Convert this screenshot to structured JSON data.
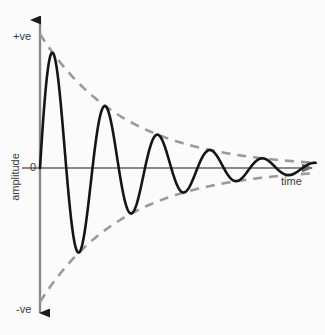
{
  "figure": {
    "background_color": "#fbfbfb",
    "axis_color": "#808080",
    "curve_color": "#151515",
    "envelope_color": "#9a9a9a",
    "text_color": "#3a3a3a"
  },
  "labels": {
    "positive": "+ve",
    "negative": "-ve",
    "zero": "0",
    "y_axis": "amplitude",
    "x_axis": "time"
  },
  "chart_data": {
    "type": "line",
    "title": "",
    "subtitle": "",
    "xlabel": "time",
    "ylabel": "amplitude",
    "grid": false,
    "legend": "none",
    "axis_ticks": {
      "y": [
        "+ve",
        "0",
        "-ve"
      ],
      "x": []
    },
    "xlim": [
      0,
      5.25
    ],
    "ylim": [
      -1.15,
      1.15
    ],
    "series": [
      {
        "name": "damped oscillation",
        "style": "solid",
        "color": "#151515",
        "model": "A*exp(-k*t)*sin(2*pi*t/T)",
        "amplitude": 1.0,
        "decay_constant": 0.62,
        "period": 1.0,
        "phase": 0,
        "x": [
          0,
          0.25,
          0.5,
          0.75,
          1.0,
          1.25,
          1.5,
          1.75,
          2.0,
          2.25,
          2.5,
          2.75,
          3.0,
          3.25,
          3.5,
          3.75,
          4.0,
          4.25,
          4.5,
          4.75,
          5.0,
          5.25
        ],
        "values": [
          0,
          0.857,
          0,
          -0.735,
          0,
          0.458,
          0,
          -0.393,
          0,
          0.245,
          0,
          -0.21,
          0,
          0.131,
          0,
          -0.112,
          0,
          0.07,
          0,
          -0.06,
          0,
          0.037
        ]
      },
      {
        "name": "upper envelope",
        "style": "dashed",
        "color": "#9a9a9a",
        "model": "A*exp(-k*t)",
        "x": [
          0,
          0.5,
          1.0,
          1.5,
          2.0,
          2.5,
          3.0,
          3.5,
          4.0,
          4.5,
          5.0,
          5.25
        ],
        "values": [
          1.0,
          0.733,
          0.538,
          0.394,
          0.289,
          0.212,
          0.155,
          0.114,
          0.083,
          0.061,
          0.045,
          0.038
        ]
      },
      {
        "name": "lower envelope",
        "style": "dashed",
        "color": "#9a9a9a",
        "model": "-A*exp(-k*t)",
        "x": [
          0,
          0.5,
          1.0,
          1.5,
          2.0,
          2.5,
          3.0,
          3.5,
          4.0,
          4.5,
          5.0,
          5.25
        ],
        "values": [
          -1.0,
          -0.733,
          -0.538,
          -0.394,
          -0.289,
          -0.212,
          -0.155,
          -0.114,
          -0.083,
          -0.061,
          -0.045,
          -0.038
        ]
      }
    ],
    "key_points": {
      "peaks": [
        {
          "x": 0.25,
          "y": 0.857
        },
        {
          "x": 1.25,
          "y": 0.458
        },
        {
          "x": 2.25,
          "y": 0.245
        },
        {
          "x": 3.25,
          "y": 0.131
        },
        {
          "x": 4.25,
          "y": 0.07
        }
      ],
      "troughs": [
        {
          "x": 0.75,
          "y": -0.735
        },
        {
          "x": 1.75,
          "y": -0.393
        },
        {
          "x": 2.75,
          "y": -0.21
        },
        {
          "x": 3.75,
          "y": -0.112
        },
        {
          "x": 4.75,
          "y": -0.06
        }
      ]
    }
  }
}
